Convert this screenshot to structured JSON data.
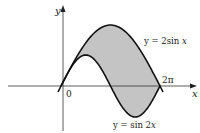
{
  "diagram": {
    "axes": {
      "x_label": "x",
      "y_label": "y",
      "origin_label": "0",
      "tick_label": "2π"
    },
    "curves": [
      {
        "name": "upper",
        "label": "y = 2sin x",
        "label_prefix": "y = 2sin ",
        "label_var": "x"
      },
      {
        "name": "lower",
        "label": "y = sin 2x",
        "label_prefix": "y = sin 2",
        "label_var": "x"
      }
    ],
    "shaded_region": {
      "description": "area between the two curves",
      "color": "#c4c4c4"
    },
    "colors": {
      "curve": "#111111",
      "axis": "#333333",
      "fill": "#c4c4c4"
    }
  }
}
